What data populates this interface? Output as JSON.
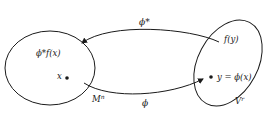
{
  "diagram": {
    "type": "mapping-diagram",
    "colors": {
      "stroke": "#1a1a1a",
      "background": "#ffffff"
    },
    "domain_set": {
      "label": "M",
      "superscript": "n",
      "point_label": "x",
      "function_label": "ϕ*f(x)"
    },
    "codomain_set": {
      "label": "V",
      "superscript": "r",
      "point_label": "y = ϕ(x)",
      "function_label": "f(y)"
    },
    "arrows": {
      "forward": {
        "label": "ϕ",
        "from": "M^n",
        "to": "V^r"
      },
      "pullback": {
        "label": "ϕ*",
        "from": "V^r",
        "to": "M^n"
      }
    }
  }
}
